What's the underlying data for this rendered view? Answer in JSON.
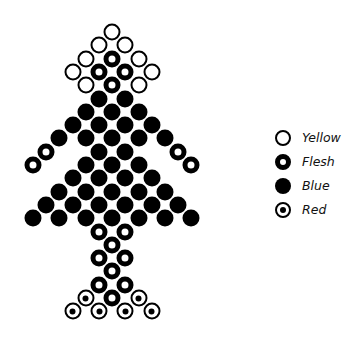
{
  "diagram": {
    "grid": {
      "x0": 33,
      "y0": 32,
      "dx": 13.2,
      "dy": 13.3
    },
    "rows": [
      {
        "row": 0,
        "beads": [
          {
            "c": 6,
            "color": "yellow"
          }
        ]
      },
      {
        "row": 1,
        "beads": [
          {
            "c": 5,
            "color": "yellow"
          },
          {
            "c": 7,
            "color": "yellow"
          }
        ]
      },
      {
        "row": 2,
        "beads": [
          {
            "c": 4,
            "color": "yellow"
          },
          {
            "c": 6,
            "color": "flesh"
          },
          {
            "c": 8,
            "color": "yellow"
          }
        ]
      },
      {
        "row": 3,
        "beads": [
          {
            "c": 3,
            "color": "yellow"
          },
          {
            "c": 5,
            "color": "flesh"
          },
          {
            "c": 7,
            "color": "flesh"
          },
          {
            "c": 9,
            "color": "yellow"
          }
        ]
      },
      {
        "row": 4,
        "beads": [
          {
            "c": 4,
            "color": "yellow"
          },
          {
            "c": 6,
            "color": "flesh"
          },
          {
            "c": 8,
            "color": "yellow"
          }
        ]
      },
      {
        "row": 5,
        "beads": [
          {
            "c": 5,
            "color": "blue"
          },
          {
            "c": 7,
            "color": "blue"
          }
        ]
      },
      {
        "row": 6,
        "beads": [
          {
            "c": 4,
            "color": "blue"
          },
          {
            "c": 6,
            "color": "blue"
          },
          {
            "c": 8,
            "color": "blue"
          }
        ]
      },
      {
        "row": 7,
        "beads": [
          {
            "c": 3,
            "color": "blue"
          },
          {
            "c": 5,
            "color": "blue"
          },
          {
            "c": 7,
            "color": "blue"
          },
          {
            "c": 9,
            "color": "blue"
          }
        ]
      },
      {
        "row": 8,
        "beads": [
          {
            "c": 2,
            "color": "blue"
          },
          {
            "c": 4,
            "color": "blue"
          },
          {
            "c": 6,
            "color": "blue"
          },
          {
            "c": 8,
            "color": "blue"
          },
          {
            "c": 10,
            "color": "blue"
          }
        ]
      },
      {
        "row": 9,
        "beads": [
          {
            "c": 1,
            "color": "flesh"
          },
          {
            "c": 5,
            "color": "blue"
          },
          {
            "c": 7,
            "color": "blue"
          },
          {
            "c": 11,
            "color": "flesh"
          }
        ]
      },
      {
        "row": 10,
        "beads": [
          {
            "c": 0,
            "color": "flesh"
          },
          {
            "c": 4,
            "color": "blue"
          },
          {
            "c": 6,
            "color": "blue"
          },
          {
            "c": 8,
            "color": "blue"
          },
          {
            "c": 12,
            "color": "flesh"
          }
        ]
      },
      {
        "row": 11,
        "beads": [
          {
            "c": 3,
            "color": "blue"
          },
          {
            "c": 5,
            "color": "blue"
          },
          {
            "c": 7,
            "color": "blue"
          },
          {
            "c": 9,
            "color": "blue"
          }
        ]
      },
      {
        "row": 12,
        "beads": [
          {
            "c": 2,
            "color": "blue"
          },
          {
            "c": 4,
            "color": "blue"
          },
          {
            "c": 6,
            "color": "blue"
          },
          {
            "c": 8,
            "color": "blue"
          },
          {
            "c": 10,
            "color": "blue"
          }
        ]
      },
      {
        "row": 13,
        "beads": [
          {
            "c": 1,
            "color": "blue"
          },
          {
            "c": 3,
            "color": "blue"
          },
          {
            "c": 5,
            "color": "blue"
          },
          {
            "c": 7,
            "color": "blue"
          },
          {
            "c": 9,
            "color": "blue"
          },
          {
            "c": 11,
            "color": "blue"
          }
        ]
      },
      {
        "row": 14,
        "beads": [
          {
            "c": 0,
            "color": "blue"
          },
          {
            "c": 2,
            "color": "blue"
          },
          {
            "c": 4,
            "color": "blue"
          },
          {
            "c": 6,
            "color": "blue"
          },
          {
            "c": 8,
            "color": "blue"
          },
          {
            "c": 10,
            "color": "blue"
          },
          {
            "c": 12,
            "color": "blue"
          }
        ]
      },
      {
        "row": 15,
        "beads": [
          {
            "c": 5,
            "color": "flesh"
          },
          {
            "c": 7,
            "color": "flesh"
          }
        ]
      },
      {
        "row": 16,
        "beads": [
          {
            "c": 6,
            "color": "flesh"
          }
        ]
      },
      {
        "row": 17,
        "beads": [
          {
            "c": 5,
            "color": "flesh"
          },
          {
            "c": 7,
            "color": "flesh"
          }
        ]
      },
      {
        "row": 18,
        "beads": [
          {
            "c": 6,
            "color": "flesh"
          }
        ]
      },
      {
        "row": 19,
        "beads": [
          {
            "c": 5,
            "color": "flesh"
          },
          {
            "c": 7,
            "color": "flesh"
          }
        ]
      },
      {
        "row": 20,
        "beads": [
          {
            "c": 4,
            "color": "red"
          },
          {
            "c": 6,
            "color": "flesh"
          },
          {
            "c": 8,
            "color": "red"
          }
        ]
      },
      {
        "row": 21,
        "beads": [
          {
            "c": 3,
            "color": "red"
          },
          {
            "c": 5,
            "color": "red"
          },
          {
            "c": 7,
            "color": "red"
          },
          {
            "c": 9,
            "color": "red"
          }
        ]
      }
    ]
  },
  "legend": {
    "items": [
      {
        "key": "yellow",
        "label": "Yellow",
        "icon": "open-ring-icon"
      },
      {
        "key": "flesh",
        "label": "Flesh",
        "icon": "thick-ring-icon"
      },
      {
        "key": "blue",
        "label": "Blue",
        "icon": "filled-circle-icon"
      },
      {
        "key": "red",
        "label": "Red",
        "icon": "dotted-ring-icon"
      }
    ]
  }
}
